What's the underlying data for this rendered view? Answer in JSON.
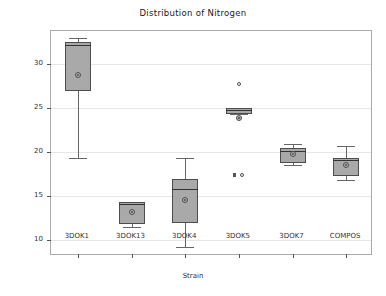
{
  "chart_data": {
    "type": "box",
    "title": "Distribution of Nitrogen",
    "xlabel": "Strain",
    "ylabel": "Nitrogen",
    "ylim": [
      8.2,
      33.8
    ],
    "yticks": [
      10,
      15,
      20,
      25,
      30
    ],
    "ytick_labels": [
      "10",
      "15",
      "20",
      "25",
      "30"
    ],
    "grid": "horizontal",
    "legend": "none",
    "categories": [
      "3DOK1",
      "3DOK13",
      "3DOK4",
      "3DOK5",
      "3DOK7",
      "COMPOS"
    ],
    "boxes": [
      {
        "category": "3DOK1",
        "whisker_low": 19.4,
        "q1": 27.0,
        "median": 32.2,
        "q3": 32.6,
        "whisker_high": 33.0,
        "mean": 28.8,
        "outliers": []
      },
      {
        "category": "3DOK13",
        "whisker_low": 11.5,
        "q1": 11.8,
        "median": 14.1,
        "q3": 14.3,
        "whisker_high": 14.4,
        "mean": 13.2,
        "outliers": []
      },
      {
        "category": "3DOK4",
        "whisker_low": 9.2,
        "q1": 11.9,
        "median": 15.8,
        "q3": 17.0,
        "whisker_high": 19.4,
        "mean": 14.6,
        "outliers": []
      },
      {
        "category": "3DOK5",
        "whisker_low": 24.4,
        "q1": 24.4,
        "median": 24.8,
        "q3": 25.0,
        "whisker_high": 25.0,
        "mean": 23.9,
        "outliers": [
          27.8,
          17.4,
          17.4
        ]
      },
      {
        "category": "3DOK7",
        "whisker_low": 18.6,
        "q1": 18.8,
        "median": 20.2,
        "q3": 20.5,
        "whisker_high": 21.0,
        "mean": 19.8,
        "outliers": []
      },
      {
        "category": "COMPOS",
        "whisker_low": 16.8,
        "q1": 17.3,
        "median": 19.1,
        "q3": 19.3,
        "whisker_high": 20.7,
        "mean": 18.6,
        "outliers": []
      }
    ],
    "colors": {
      "box_fill": "#a9a9a9",
      "box_edge": "#4d4d4d",
      "whisker": "#666666",
      "median": "#333333",
      "grid": "#e6e6e6",
      "frame": "#aaaaaa",
      "text": "#333333"
    }
  }
}
